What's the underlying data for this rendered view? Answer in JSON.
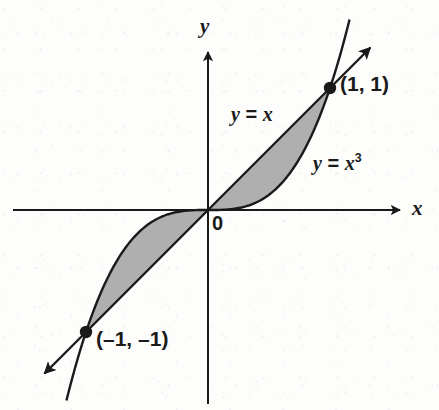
{
  "figure": {
    "background_color": "#fdfdfc",
    "ink_color": "#1a1a1a",
    "shade_color": "#a8a8a8"
  },
  "axes": {
    "x_label": "x",
    "y_label": "y",
    "origin_label": "0",
    "origin_px": {
      "x": 208,
      "y": 210
    },
    "unit_px": 122,
    "x_axis_has_arrow_right": true,
    "y_axis_has_arrow_up": true
  },
  "curves": {
    "line": {
      "label_y": "y",
      "label_eq": "=",
      "label_x": "x",
      "label_full": "y = x"
    },
    "cubic": {
      "label_y": "y",
      "label_eq": "=",
      "label_x": "x",
      "label_exp": "3",
      "label_full": "y = x3"
    }
  },
  "points": [
    {
      "name": "upper-intersection",
      "label": "(1, 1)",
      "x": 1,
      "y": 1
    },
    {
      "name": "lower-intersection",
      "label": "(–1, –1)",
      "x": -1,
      "y": -1
    }
  ],
  "chart_data": {
    "type": "line",
    "title": "",
    "xlabel": "x",
    "ylabel": "y",
    "xlim": [
      -1.6,
      1.6
    ],
    "ylim": [
      -1.6,
      1.6
    ],
    "grid": false,
    "legend": "inline-annotations",
    "series": [
      {
        "name": "y = x",
        "x": [
          -1.5,
          -1.25,
          -1.0,
          -0.75,
          -0.5,
          -0.25,
          0,
          0.25,
          0.5,
          0.75,
          1.0,
          1.25,
          1.5
        ],
        "values": [
          -1.5,
          -1.25,
          -1.0,
          -0.75,
          -0.5,
          -0.25,
          0,
          0.25,
          0.5,
          0.75,
          1.0,
          1.25,
          1.5
        ]
      },
      {
        "name": "y = x3",
        "x": [
          -1.5,
          -1.25,
          -1.0,
          -0.75,
          -0.5,
          -0.25,
          0,
          0.25,
          0.5,
          0.75,
          1.0,
          1.25,
          1.5
        ],
        "values": [
          -3.375,
          -1.953,
          -1.0,
          -0.422,
          -0.125,
          -0.016,
          0,
          0.016,
          0.125,
          0.422,
          1.0,
          1.953,
          3.375
        ]
      }
    ],
    "shaded_regions": [
      {
        "name": "quadrant-I-lens",
        "x_from": 0,
        "x_to": 1,
        "between": [
          "y = x",
          "y = x3"
        ]
      },
      {
        "name": "quadrant-III-lens",
        "x_from": -1,
        "x_to": 0,
        "between": [
          "y = x3",
          "y = x"
        ]
      }
    ],
    "annotations": [
      {
        "text": "y = x",
        "x": 0.2,
        "y": 0.88
      },
      {
        "text": "y = x3",
        "x": 0.88,
        "y": 0.48
      },
      {
        "text": "(1, 1)",
        "x": 1.1,
        "y": 1.05
      },
      {
        "text": "(–1, –1)",
        "x": -0.9,
        "y": -1.02
      },
      {
        "text": "0",
        "x": 0.04,
        "y": -0.06
      }
    ]
  }
}
